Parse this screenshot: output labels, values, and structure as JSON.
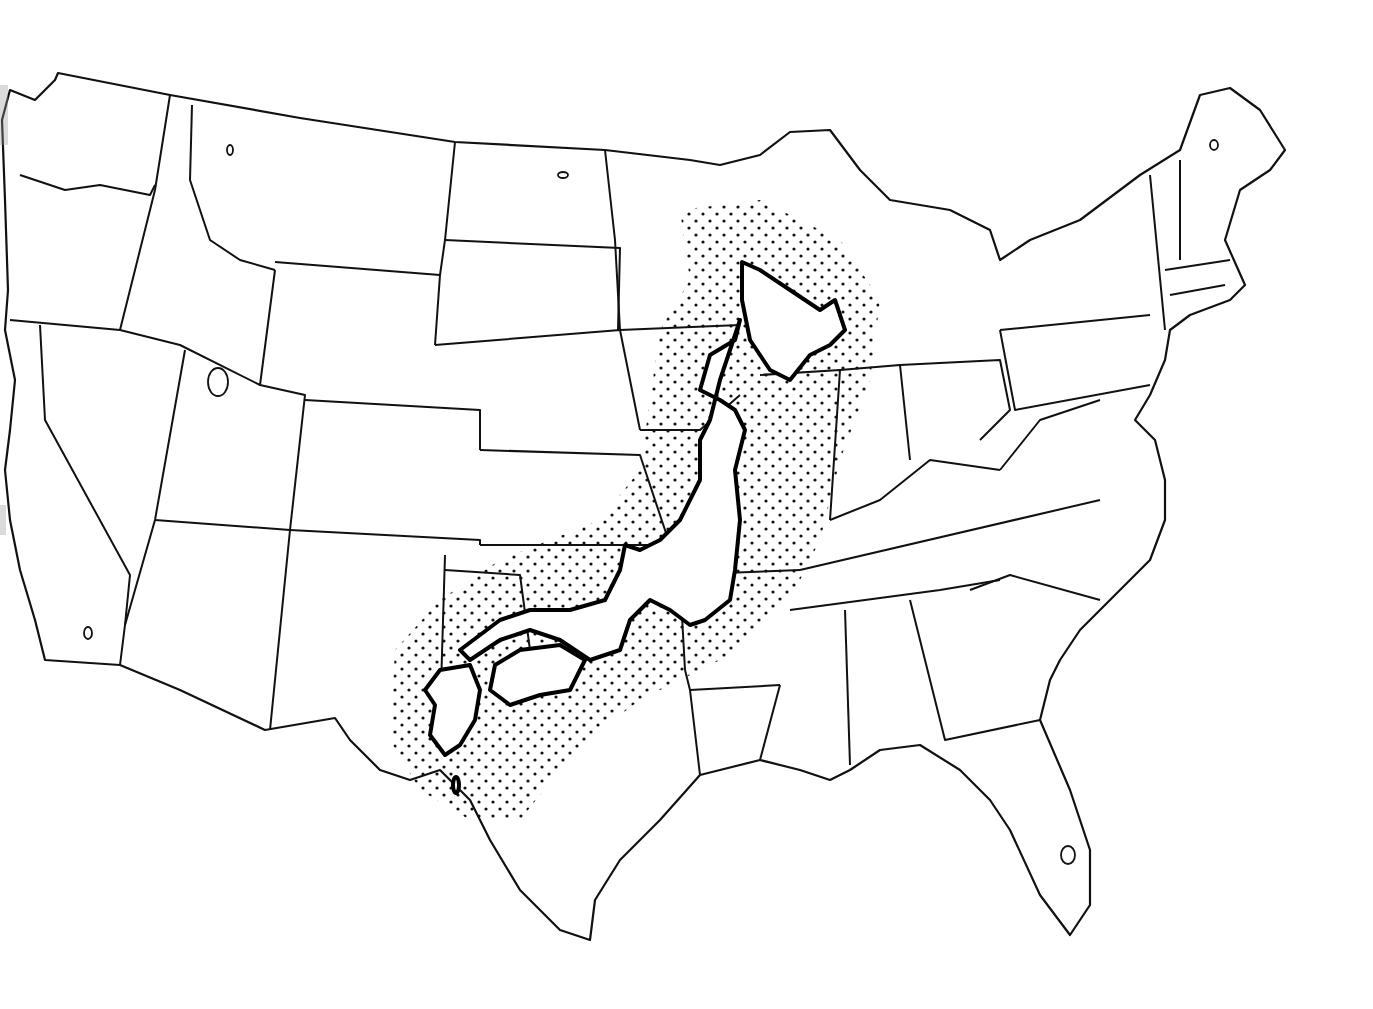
{
  "map": {
    "title": "Japan superimposed on the contiguous United States",
    "style": "black-and-white line drawing",
    "background_color": "#ffffff",
    "line_color": "#111111",
    "base_layer": "Contiguous United States state boundaries",
    "overlay_layer": "Outline of Japan (Hokkaido, Honshu, Shikoku, Kyushu) with dot-stippled surrounding sea area",
    "overlay_regions": [
      {
        "name": "Hokkaido",
        "position": "Wisconsin / Michigan / Illinois area"
      },
      {
        "name": "Honshu",
        "position": "Iowa-Missouri through Arkansas-Oklahoma"
      },
      {
        "name": "Shikoku",
        "position": "Oklahoma / north Texas area"
      },
      {
        "name": "Kyushu",
        "position": "Texas panhandle / New Mexico border area"
      }
    ],
    "stipple": "dot pattern",
    "labels": []
  }
}
